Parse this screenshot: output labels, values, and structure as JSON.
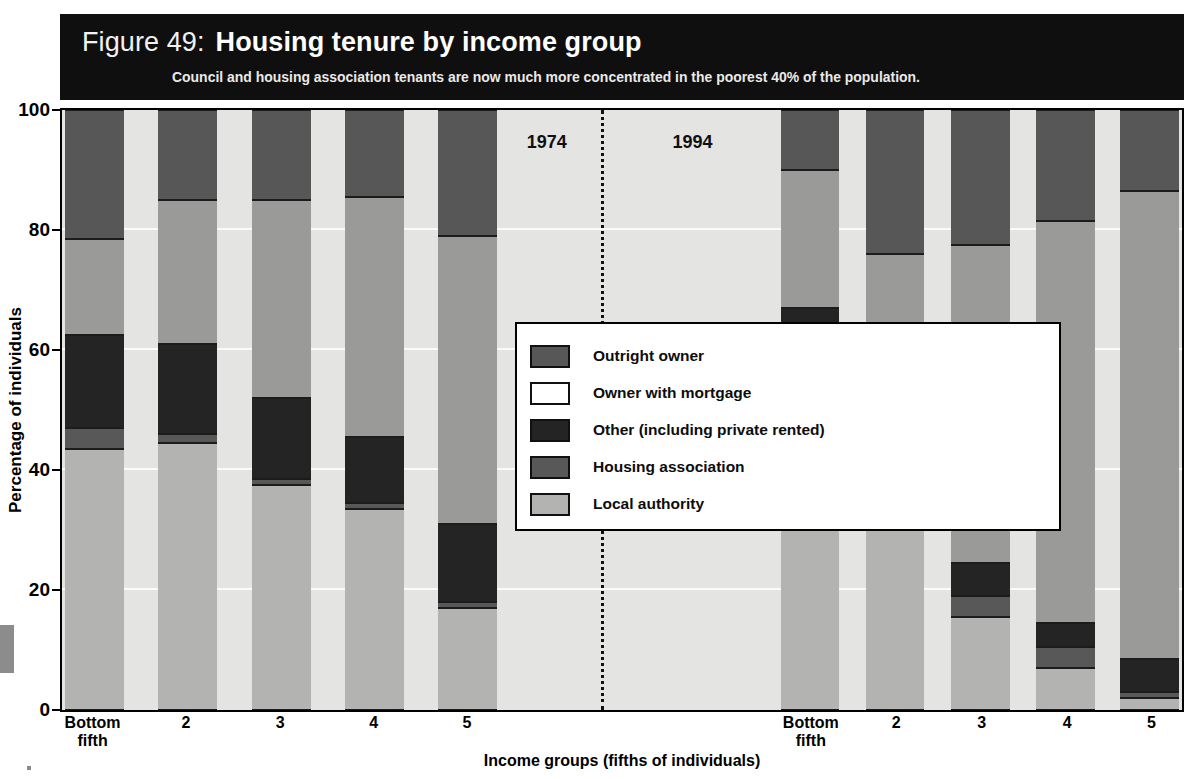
{
  "header": {
    "figure_label": "Figure 49:",
    "title": "Housing tenure by income group",
    "subtitle": "Council and housing association tenants are now much more concentrated in the poorest 40% of the population.",
    "banner_color": "#100f0f",
    "title_color": "#ffffff"
  },
  "legend": {
    "position": "center",
    "items": [
      {
        "label": "Outright owner",
        "color": "#575757",
        "key": "outright_owner"
      },
      {
        "label": "Owner with mortgage",
        "color": "#9a9a99",
        "key": "owner_with_mortgage"
      },
      {
        "label": "Other (including private rented)",
        "color": "#242424",
        "key": "other"
      },
      {
        "label": "Housing association",
        "color": "#585858",
        "key": "housing_association"
      },
      {
        "label": "Local authority",
        "color": "#b3b3b1",
        "key": "local_authority"
      }
    ]
  },
  "annotations": [
    {
      "text": "1974",
      "x_pct": 41.5,
      "y_pct": 88
    },
    {
      "text": "1994",
      "x_pct": 54.5,
      "y_pct": 88
    }
  ],
  "axes": {
    "y_ticks": [
      0,
      20,
      40,
      60,
      80,
      100
    ],
    "y_tick_labels": [
      "0",
      "20",
      "40",
      "60",
      "80",
      "100"
    ],
    "x_tick_labels_1974": [
      "Bottom\nfifth",
      "2",
      "3",
      "4",
      "5"
    ],
    "x_tick_labels_1994": [
      "Bottom\nfifth",
      "2",
      "3",
      "4",
      "5"
    ]
  },
  "chart_data": {
    "type": "bar",
    "subtype": "stacked-percentage",
    "title": "Housing tenure by income group",
    "subtitle": "Council and housing association tenants are now much more concentrated in the poorest 40% of the population.",
    "xlabel": "Income groups (fifths of individuals)",
    "ylabel": "Percentage of individuals",
    "ylim": [
      0,
      100
    ],
    "yticks": [
      0,
      20,
      40,
      60,
      80,
      100
    ],
    "grid": true,
    "legend_position": "center",
    "groups": [
      "1974",
      "1994"
    ],
    "categories": [
      "Bottom fifth",
      "2",
      "3",
      "4",
      "5"
    ],
    "stack_order_bottom_to_top": [
      "Local authority",
      "Housing association",
      "Other (including private rented)",
      "Owner with mortgage",
      "Outright owner"
    ],
    "series": [
      {
        "name": "Local authority",
        "color": "#b3b3b1",
        "values_1974": [
          43.5,
          44.5,
          37.5,
          33.5,
          17.0
        ],
        "values_1994": [
          45.5,
          33.5,
          15.5,
          7.0,
          2.0
        ]
      },
      {
        "name": "Housing association",
        "color": "#585858",
        "values_1974": [
          3.5,
          1.5,
          1.0,
          1.0,
          1.0
        ],
        "values_1994": [
          8.0,
          4.5,
          3.5,
          3.5,
          1.0
        ]
      },
      {
        "name": "Other (including private rented)",
        "color": "#242424",
        "values_1974": [
          15.5,
          15.0,
          13.5,
          11.0,
          13.0
        ],
        "values_1994": [
          13.5,
          9.0,
          5.5,
          4.0,
          5.5
        ]
      },
      {
        "name": "Owner with mortgage",
        "color": "#9a9a99",
        "values_1974": [
          16.0,
          24.0,
          33.0,
          40.0,
          48.0
        ],
        "values_1994": [
          23.0,
          29.0,
          53.0,
          67.0,
          78.0
        ]
      },
      {
        "name": "Outright owner",
        "color": "#575757",
        "values_1974": [
          21.5,
          15.0,
          15.0,
          14.5,
          21.0
        ],
        "values_1994": [
          10.0,
          24.0,
          22.5,
          18.5,
          13.5
        ]
      }
    ],
    "cumulative_tops_1974": [
      [
        43.5,
        47.0,
        62.5,
        78.5,
        100.0
      ],
      [
        44.5,
        46.0,
        61.0,
        85.0,
        100.0
      ],
      [
        37.5,
        38.5,
        52.0,
        85.0,
        100.0
      ],
      [
        33.5,
        34.5,
        45.5,
        85.5,
        100.0
      ],
      [
        17.0,
        18.0,
        31.0,
        79.0,
        100.0
      ]
    ],
    "cumulative_tops_1994": [
      [
        45.5,
        53.5,
        67.0,
        90.0,
        100.0
      ],
      [
        33.5,
        38.0,
        47.0,
        76.0,
        100.0
      ],
      [
        15.5,
        19.0,
        24.5,
        77.5,
        100.0
      ],
      [
        7.0,
        10.5,
        14.5,
        81.5,
        100.0
      ],
      [
        2.0,
        3.0,
        8.5,
        86.5,
        100.0
      ]
    ]
  },
  "layout": {
    "bar_centers_pct": [
      2.9,
      11.2,
      19.6,
      27.9,
      36.2,
      66.8,
      74.4,
      82.0,
      89.6,
      97.1
    ],
    "bar_width_pct": 5.2,
    "divider_x_pct": 48.1
  }
}
